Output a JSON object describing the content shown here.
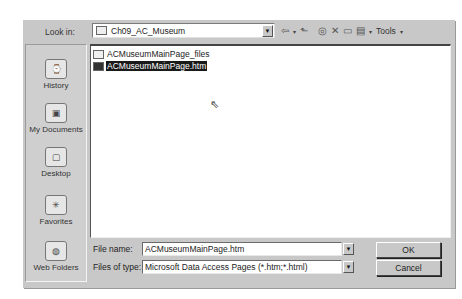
{
  "dialog": {
    "look_in_label": "Look in:",
    "look_in_value": "Ch09_AC_Museum",
    "toolbar": {
      "back": "⇦",
      "up_folder": "⬑",
      "search_web": "◎",
      "delete": "✕",
      "new_folder": "▭",
      "views": "▤",
      "dropdown_arrow": "▾",
      "tools_label": "Tools"
    },
    "places": [
      {
        "label": "History",
        "icon": "⌚"
      },
      {
        "label": "My Documents",
        "icon": "▣"
      },
      {
        "label": "Desktop",
        "icon": "▢"
      },
      {
        "label": "Favorites",
        "icon": "✳"
      },
      {
        "label": "Web Folders",
        "icon": "◍"
      }
    ],
    "files": [
      {
        "name": "ACMuseumMainPage_files",
        "selected": false
      },
      {
        "name": "ACMuseumMainPage.htm",
        "selected": true
      }
    ],
    "cursor_glyph": "⇖",
    "file_name_label": "File name:",
    "file_name_value": "ACMuseumMainPage.htm",
    "file_type_label": "Files of type:",
    "file_type_value": "Microsoft Data Access Pages (*.htm;*.html)",
    "combo_arrow": "▼",
    "ok_label": "OK",
    "cancel_label": "Cancel"
  }
}
